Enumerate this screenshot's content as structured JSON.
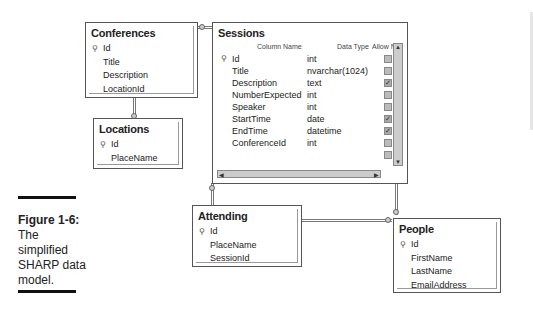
{
  "figure": {
    "label": "Figure 1-6:",
    "caption_lines": [
      "The",
      "simplified",
      "SHARP data",
      "model."
    ]
  },
  "tables": {
    "conferences": {
      "title": "Conferences",
      "key": "Id",
      "fields": [
        "Title",
        "Description",
        "LocationId"
      ]
    },
    "locations": {
      "title": "Locations",
      "key": "Id",
      "fields": [
        "PlaceName"
      ]
    },
    "attending": {
      "title": "Attending",
      "key": "Id",
      "fields": [
        "PlaceName",
        "SessionId"
      ]
    },
    "people": {
      "title": "People",
      "key": "Id",
      "fields": [
        "FirstName",
        "LastName",
        "EmailAddress"
      ]
    },
    "sessions": {
      "title": "Sessions",
      "headers": {
        "name": "Column Name",
        "type": "Data Type",
        "nulls": "Allow Nulls"
      },
      "rows": [
        {
          "name": "Id",
          "type": "int",
          "allow_null": false,
          "key": true
        },
        {
          "name": "Title",
          "type": "nvarchar(1024)",
          "allow_null": false
        },
        {
          "name": "Description",
          "type": "text",
          "allow_null": true
        },
        {
          "name": "NumberExpected",
          "type": "int",
          "allow_null": false
        },
        {
          "name": "Speaker",
          "type": "int",
          "allow_null": false
        },
        {
          "name": "StartTime",
          "type": "date",
          "allow_null": true
        },
        {
          "name": "EndTime",
          "type": "datetime",
          "allow_null": true
        },
        {
          "name": "ConferenceId",
          "type": "int",
          "allow_null": false
        },
        {
          "name": "",
          "type": "",
          "allow_null": false
        }
      ]
    }
  },
  "icons": {
    "key": "key-icon",
    "check": "✓"
  }
}
